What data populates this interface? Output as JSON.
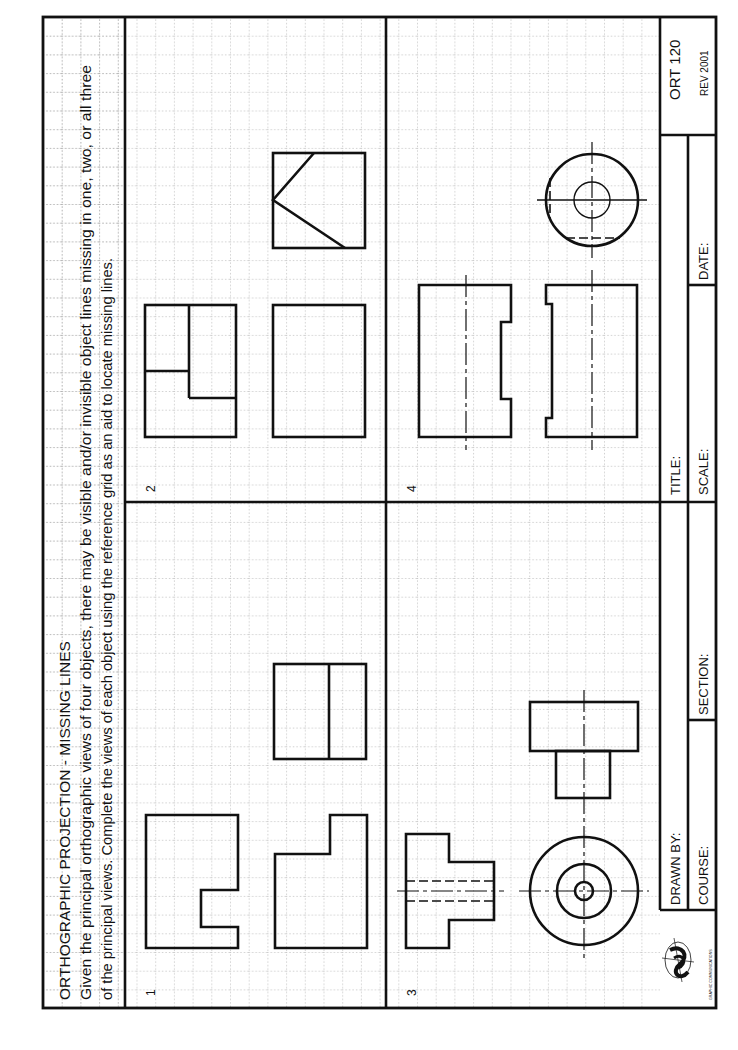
{
  "sheet": {
    "code": "ORT 120",
    "revision": "REV 2001",
    "heading": "ORTHOGRAPHIC PROJECTION - MISSING LINES",
    "instructions_line1": "Given the principal orthographic views of four objects, there may be visible and/or invisible object lines missing in one, two, or all three",
    "instructions_line2": "of the principal views. Complete the views of each object using the reference grid as an aid to locate missing lines.",
    "grid_spacing_px": 18.7,
    "colors": {
      "ink": "#111111",
      "grid": "#9a9a9a",
      "paper": "#ffffff"
    }
  },
  "problems": [
    {
      "number": "1",
      "label": "Problem 1 — stepped block"
    },
    {
      "number": "2",
      "label": "Problem 2 — angled block"
    },
    {
      "number": "3",
      "label": "Problem 3 — flanged cylinder with bore"
    },
    {
      "number": "4",
      "label": "Problem 4 — cylinder with flat and groove"
    }
  ],
  "title_block": {
    "drawn_by_label": "DRAWN BY:",
    "course_label": "COURSE:",
    "section_label": "SECTION:",
    "title_label": "TITLE:",
    "scale_label": "SCALE:",
    "date_label": "DATE:",
    "drawn_by_value": "",
    "course_value": "",
    "section_value": "",
    "title_value": "",
    "scale_value": "",
    "date_value": "",
    "logo_caption": "GRAPHIC COMMUNICATIONS"
  }
}
